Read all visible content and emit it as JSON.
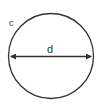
{
  "diagram": {
    "labels": {
      "circumference": "c",
      "diameter": "d"
    },
    "colors": {
      "stroke": "#333333",
      "background": "#ffffff"
    }
  }
}
